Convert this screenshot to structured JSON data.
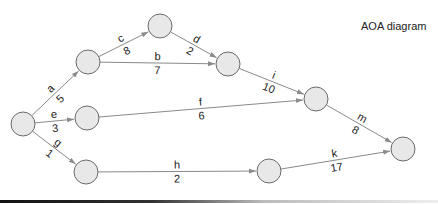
{
  "title": "AOA diagram",
  "colors": {
    "node_fill": "#e8e8e8",
    "node_stroke": "#6a6a6a",
    "edge": "#8a8a8a",
    "text": "#222222"
  },
  "nodes": [
    {
      "id": "n1",
      "x": 23,
      "y": 124
    },
    {
      "id": "n2",
      "x": 88,
      "y": 62
    },
    {
      "id": "n3",
      "x": 160,
      "y": 26
    },
    {
      "id": "n4",
      "x": 228,
      "y": 64
    },
    {
      "id": "n5",
      "x": 87,
      "y": 118
    },
    {
      "id": "n6",
      "x": 316,
      "y": 99
    },
    {
      "id": "n7",
      "x": 86,
      "y": 172
    },
    {
      "id": "n8",
      "x": 269,
      "y": 171
    },
    {
      "id": "n9",
      "x": 403,
      "y": 149
    }
  ],
  "activities": [
    {
      "name": "a",
      "duration": "5",
      "from": "n1",
      "to": "n2"
    },
    {
      "name": "b",
      "duration": "7",
      "from": "n2",
      "to": "n4"
    },
    {
      "name": "c",
      "duration": "8",
      "from": "n2",
      "to": "n3"
    },
    {
      "name": "d",
      "duration": "2",
      "from": "n3",
      "to": "n4"
    },
    {
      "name": "e",
      "duration": "3",
      "from": "n1",
      "to": "n5"
    },
    {
      "name": "f",
      "duration": "6",
      "from": "n5",
      "to": "n6"
    },
    {
      "name": "g",
      "duration": "1",
      "from": "n1",
      "to": "n7"
    },
    {
      "name": "h",
      "duration": "2",
      "from": "n7",
      "to": "n8"
    },
    {
      "name": "i",
      "duration": "10",
      "from": "n4",
      "to": "n6"
    },
    {
      "name": "k",
      "duration": "17",
      "from": "n8",
      "to": "n9"
    },
    {
      "name": "m",
      "duration": "8",
      "from": "n6",
      "to": "n9"
    }
  ]
}
